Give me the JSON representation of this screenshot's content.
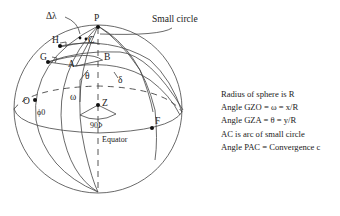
{
  "diagram": {
    "points": {
      "P": "P",
      "H": "H",
      "G": "G",
      "A": "A",
      "B": "B",
      "C": "C",
      "O": "O",
      "Z": "Z",
      "F": "F"
    },
    "greek": {
      "delta_lambda": "Δλ",
      "theta": "θ",
      "omega": "ω",
      "delta": "δ",
      "phi0": "ϕ0",
      "ninety_phi": "90Þ"
    },
    "labels": {
      "small_circle": "Small circle",
      "equator": "Equator"
    }
  },
  "legend": {
    "lines": [
      "Radius of sphere is R",
      "Angle GZO = ω = x/R",
      "Angle GZA = θ = y/R",
      "AC is arc of small circle",
      "Angle PAC = Convergence c"
    ]
  }
}
